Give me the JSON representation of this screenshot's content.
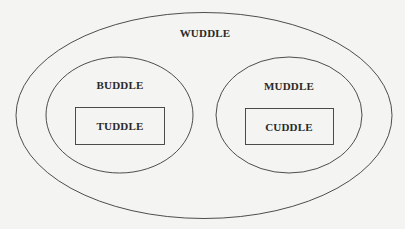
{
  "diagram": {
    "type": "nested-containment",
    "background": "#f4f4f2",
    "stroke_color": "#3a3a3a",
    "outer": {
      "label": "WUDDLE",
      "shape": "ellipse",
      "children": [
        {
          "label": "BUDDLE",
          "shape": "ellipse",
          "children": [
            {
              "label": "TUDDLE",
              "shape": "rectangle"
            }
          ]
        },
        {
          "label": "MUDDLE",
          "shape": "ellipse",
          "children": [
            {
              "label": "CUDDLE",
              "shape": "rectangle"
            }
          ]
        }
      ]
    }
  }
}
